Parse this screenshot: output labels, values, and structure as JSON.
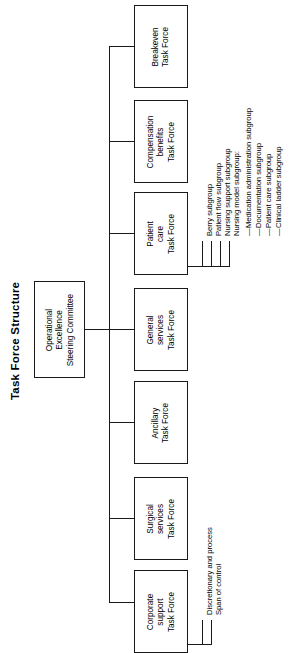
{
  "title": "Task Force Structure",
  "root": {
    "label": "Operational\nExcellence\nSteering Committee",
    "line1": "Operational",
    "line2": "Excellence",
    "line3": "Steering Committee"
  },
  "task_forces": [
    {
      "id": "breakeven",
      "line1": "Breakeven",
      "line2": "Task Force",
      "line3": ""
    },
    {
      "id": "compensation",
      "line1": "Compensation",
      "line2": "benefits",
      "line3": "Task Force"
    },
    {
      "id": "patient-care",
      "line1": "Patient",
      "line2": "care",
      "line3": "Task Force"
    },
    {
      "id": "general-services",
      "line1": "General",
      "line2": "services",
      "line3": "Task Force"
    },
    {
      "id": "ancillary",
      "line1": "Ancillary",
      "line2": "Task Force",
      "line3": ""
    },
    {
      "id": "surgical-services",
      "line1": "Surgical",
      "line2": "services",
      "line3": "Task Force"
    },
    {
      "id": "corporate-support",
      "line1": "Corporate",
      "line2": "support",
      "line3": "Task Force"
    }
  ],
  "patient_care_subgroups": [
    {
      "label": "Berry subgroup"
    },
    {
      "label": "Patient flow subgroup"
    },
    {
      "label": "Nursing support subgroup"
    },
    {
      "label": "Nursing model subgroup:"
    }
  ],
  "nursing_model_subgroups": [
    {
      "dash": "—",
      "label": "Medication administration subgroup"
    },
    {
      "dash": "—",
      "label": "Documentation subgroup"
    },
    {
      "dash": "—",
      "label": "Patient care subgroup"
    },
    {
      "dash": "—",
      "label": "Clinical ladder subgroup"
    }
  ],
  "corporate_support_notes": [
    {
      "label": "Discretionary and process"
    },
    {
      "label": "Span of control"
    }
  ],
  "colors": {
    "line": "#1a1a1a",
    "background": "#ffffff",
    "text": "#000000"
  }
}
